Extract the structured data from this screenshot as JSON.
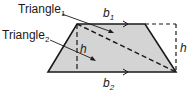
{
  "diagram": {
    "labels": {
      "triangle1": "Triangle",
      "triangle1_sub": "1",
      "triangle2": "Triangle",
      "triangle2_sub": "2",
      "b1": "b",
      "b1_sub": "1",
      "b2": "b",
      "b2_sub": "2",
      "h_inner": "h",
      "h_outer": "h"
    },
    "colors": {
      "fill": "#d4d4d4",
      "stroke": "#1a1a1a"
    }
  }
}
